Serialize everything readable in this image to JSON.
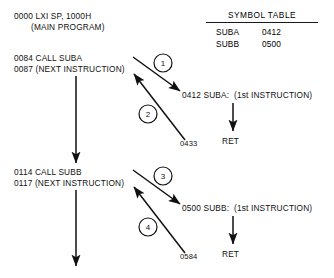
{
  "diagram": {
    "main_program": {
      "line1": "0000 LXI SP, 1000H",
      "line2": "(MAIN PROGRAM)",
      "call_a_line1": "0084 CALL SUBA",
      "call_a_line2": "0087 (NEXT INSTRUCTION)",
      "call_b_line1": "0114 CALL SUBB",
      "call_b_line2": "0117 (NEXT INSTRUCTION)"
    },
    "symbol_table": {
      "title": "SYMBOL TABLE",
      "rows": [
        {
          "name": "SUBA",
          "address": "0412"
        },
        {
          "name": "SUBB",
          "address": "0500"
        }
      ]
    },
    "subroutines": [
      {
        "header": "0412 SUBA:  (1st INSTRUCTION)",
        "return_address": "0433",
        "ret": "RET"
      },
      {
        "header": "0500 SUBB:  (1st INSTRUCTION)",
        "return_address": "0584",
        "ret": "RET"
      }
    ],
    "steps": [
      {
        "number": "1"
      },
      {
        "number": "2"
      },
      {
        "number": "3"
      },
      {
        "number": "4"
      }
    ],
    "colors": {
      "ink": "#111111",
      "background": "#ffffff"
    }
  }
}
